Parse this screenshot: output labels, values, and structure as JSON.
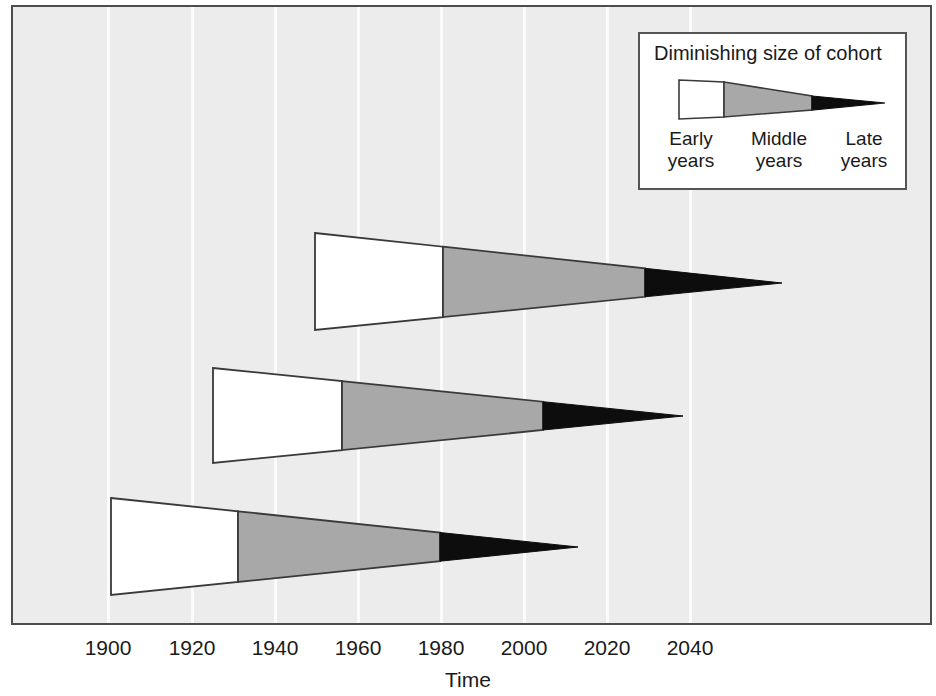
{
  "chart_data": {
    "type": "area",
    "title": "",
    "xlabel": "Time",
    "ylabel": "",
    "xlim": [
      1886,
      2061
    ],
    "grid": true,
    "legend_position": "top-right",
    "x_ticks": [
      1900,
      1920,
      1940,
      1960,
      1980,
      2000,
      2020,
      2040
    ],
    "x_tick_labels": [
      "1900",
      "1920",
      "1940",
      "1960",
      "1980",
      "2000",
      "2020",
      "2040"
    ],
    "series": [
      {
        "name": "Cohort 3 (latest)",
        "row": 0,
        "start_year": 1950,
        "end_year": 2062,
        "early_end_year": 1981,
        "middle_end_year": 2030,
        "px": {
          "x_start": 315,
          "x_early_end": 443,
          "x_middle_end": 645,
          "x_tip": 782,
          "y_top": 233,
          "y_bottom": 330,
          "y_tip": 283
        }
      },
      {
        "name": "Cohort 2 (middle)",
        "row": 1,
        "start_year": 1925,
        "end_year": 2038,
        "early_end_year": 1956,
        "middle_end_year": 2005,
        "px": {
          "x_start": 213,
          "x_early_end": 342,
          "x_middle_end": 543,
          "x_tip": 683,
          "y_top": 368,
          "y_bottom": 463,
          "y_tip": 416
        }
      },
      {
        "name": "Cohort 1 (earliest)",
        "row": 2,
        "start_year": 1901,
        "end_year": 2013,
        "early_end_year": 1932,
        "middle_end_year": 1980,
        "px": {
          "x_start": 111,
          "x_early_end": 238,
          "x_middle_end": 440,
          "x_tip": 578,
          "y_top": 498,
          "y_bottom": 595,
          "y_tip": 547
        }
      }
    ],
    "phases": [
      {
        "key": "early",
        "label": "Early years",
        "color": "#ffffff"
      },
      {
        "key": "middle",
        "label": "Middle years",
        "color": "#a8a8a8"
      },
      {
        "key": "late",
        "label": "Late years",
        "color": "#0d0d0d"
      }
    ]
  },
  "legend": {
    "title": "Diminishing size of cohort",
    "labels": {
      "early": "Early\nyears",
      "early_line1": "Early",
      "early_line2": "years",
      "middle_line1": "Middle",
      "middle_line2": "years",
      "late_line1": "Late",
      "late_line2": "years"
    }
  },
  "axis": {
    "title": "Time",
    "ticks": [
      {
        "label": "1900",
        "x": 108
      },
      {
        "label": "1920",
        "x": 192
      },
      {
        "label": "1940",
        "x": 275
      },
      {
        "label": "1960",
        "x": 358
      },
      {
        "label": "1980",
        "x": 441
      },
      {
        "label": "2000",
        "x": 524
      },
      {
        "label": "2020",
        "x": 607
      },
      {
        "label": "2040",
        "x": 690
      }
    ]
  },
  "colors": {
    "plot_background": "#ececec",
    "gridline": "#fbfbfb",
    "frame": "#4d4d4d",
    "wedge_outline": "#3a3a3a",
    "early_fill": "#ffffff",
    "middle_fill": "#a8a8a8",
    "late_fill": "#0d0d0d",
    "text": "#1a1a1a"
  }
}
